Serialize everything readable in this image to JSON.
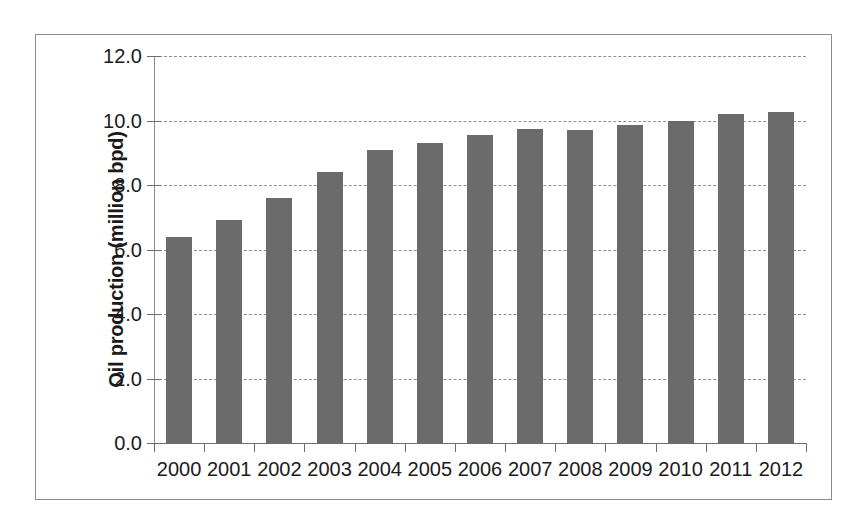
{
  "chart_data": {
    "type": "bar",
    "title": "",
    "subtitle": "",
    "xlabel": "",
    "ylabel": "Oil production (million bpd)",
    "categories": [
      "2000",
      "2001",
      "2002",
      "2003",
      "2004",
      "2005",
      "2006",
      "2007",
      "2008",
      "2009",
      "2010",
      "2011",
      "2012"
    ],
    "values": [
      6.4,
      6.9,
      7.6,
      8.4,
      9.1,
      9.3,
      9.55,
      9.75,
      9.7,
      9.85,
      10.0,
      10.2,
      10.25
    ],
    "series": [
      {
        "name": "Oil production",
        "values": [
          6.4,
          6.9,
          7.6,
          8.4,
          9.1,
          9.3,
          9.55,
          9.75,
          9.7,
          9.85,
          10.0,
          10.2,
          10.25
        ]
      }
    ],
    "ylim": [
      0.0,
      12.0
    ],
    "ytick_labels": [
      "0.0",
      "2.0",
      "4.0",
      "6.0",
      "8.0",
      "10.0",
      "12.0"
    ],
    "ytick_values": [
      0.0,
      2.0,
      4.0,
      6.0,
      8.0,
      10.0,
      12.0
    ],
    "grid": "horizontal-dashed",
    "legend": "none",
    "bar_color": "#6b6b6b",
    "gridline_color": "#8f8f8f",
    "axis_color": "#6e6e6e",
    "frame_color": "#8d8d8d",
    "background_color": "#ffffff",
    "text_color": "#1b1b1b"
  }
}
